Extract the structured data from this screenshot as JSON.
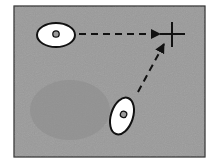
{
  "diagram": {
    "type": "movement-to-target",
    "background_color": "#9a9a9a",
    "border_color": "#2a2a2a",
    "frame": {
      "x": 14,
      "y": 6,
      "w": 191,
      "h": 151
    },
    "target": {
      "shape": "cross",
      "cx": 172,
      "cy": 34,
      "size": 12
    },
    "objects": [
      {
        "id": "left-ellipse",
        "cx": 56,
        "cy": 35,
        "rx": 19,
        "ry": 12,
        "rotation": 0,
        "dot_r": 3
      },
      {
        "id": "bottom-ellipse",
        "cx": 122,
        "cy": 116,
        "rx": 11,
        "ry": 19,
        "rotation": 18,
        "dot_r": 3
      }
    ],
    "arrows": [
      {
        "from": "left-ellipse",
        "x1": 79,
        "y1": 34,
        "x2": 160,
        "y2": 34,
        "style": "dashed"
      },
      {
        "from": "bottom-ellipse",
        "x1": 138,
        "y1": 92,
        "x2": 164,
        "y2": 44,
        "style": "dashed"
      }
    ]
  }
}
